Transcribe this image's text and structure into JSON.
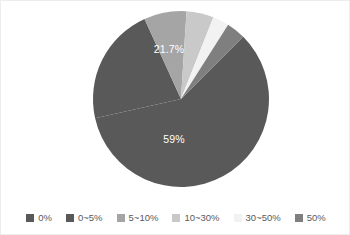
{
  "chart_data": {
    "type": "pie",
    "title": "",
    "categories": [
      "0%",
      "0~5%",
      "5~10%",
      "10~30%",
      "30~50%",
      "50%"
    ],
    "values": [
      59,
      21.7,
      7.8,
      5.0,
      3.0,
      3.5
    ],
    "colors": [
      "#595959",
      "#595959",
      "#a5a5a5",
      "#c9c9c9",
      "#f2f2f2",
      "#7f7f7f"
    ],
    "data_labels": [
      {
        "category": "0%",
        "text": "59%",
        "x": 173,
        "y": 139
      },
      {
        "category": "0~5%",
        "text": "21.7%",
        "x": 168,
        "y": 49
      }
    ],
    "legend_position": "bottom",
    "grid": false,
    "xlabel": "",
    "ylabel": ""
  },
  "pie": {
    "center_x": 180,
    "center_y": 98,
    "radius": 88,
    "start_angle_deg": -45,
    "labels": {
      "upper": "21.7%",
      "lower": "59%"
    }
  },
  "legend": {
    "items": [
      {
        "label": "0%",
        "color": "#595959"
      },
      {
        "label": "0~5%",
        "color": "#595959"
      },
      {
        "label": "5~10%",
        "color": "#a5a5a5"
      },
      {
        "label": "10~30%",
        "color": "#c9c9c9"
      },
      {
        "label": "30~50%",
        "color": "#f2f2f2"
      },
      {
        "label": "50%",
        "color": "#7f7f7f"
      }
    ]
  },
  "colors": {
    "background": "#ffffff",
    "border": "#ededed",
    "label_text": "#ffffff",
    "legend_text": "#5a5a5a"
  }
}
